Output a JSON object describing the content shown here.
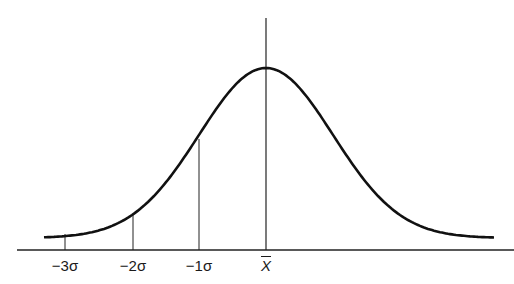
{
  "diagram": {
    "curve": {
      "color": "#111111",
      "mean_x": 266,
      "peak_y": 68,
      "baseline_y": 250,
      "sigma_px": 67
    },
    "axis": {
      "x_start": 17,
      "x_end": 514,
      "y": 250
    },
    "labels": [
      {
        "id": "minus-3-sigma",
        "text": "−3σ",
        "x": 65
      },
      {
        "id": "minus-2-sigma",
        "text": "−2σ",
        "x": 133
      },
      {
        "id": "minus-1-sigma",
        "text": "−1σ",
        "x": 199
      },
      {
        "id": "mean",
        "text": "X",
        "x": 266,
        "overline": true
      }
    ]
  }
}
